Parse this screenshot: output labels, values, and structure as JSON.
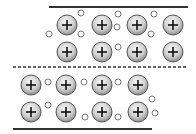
{
  "diagram": {
    "title": "",
    "top_plate": {
      "line": {
        "x1": 49,
        "x2": 188,
        "y": 7,
        "style": "solid"
      },
      "ions": [
        {
          "cx": 67,
          "cy": 25
        },
        {
          "cx": 102,
          "cy": 25
        },
        {
          "cx": 137,
          "cy": 25
        },
        {
          "cx": 173,
          "cy": 25
        },
        {
          "cx": 67,
          "cy": 52
        },
        {
          "cx": 102,
          "cy": 52
        },
        {
          "cx": 137,
          "cy": 52
        },
        {
          "cx": 173,
          "cy": 52
        }
      ],
      "electrons": [
        {
          "cx": 81,
          "cy": 13
        },
        {
          "cx": 49,
          "cy": 34
        },
        {
          "cx": 81,
          "cy": 34
        },
        {
          "cx": 118,
          "cy": 14
        },
        {
          "cx": 117,
          "cy": 27
        },
        {
          "cx": 154,
          "cy": 14
        },
        {
          "cx": 151,
          "cy": 34
        },
        {
          "cx": 118,
          "cy": 47
        }
      ]
    },
    "bottom_plate": {
      "line": {
        "x1": 13,
        "x2": 152,
        "y": 129,
        "style": "solid"
      },
      "ions": [
        {
          "cx": 31,
          "cy": 85
        },
        {
          "cx": 66,
          "cy": 85
        },
        {
          "cx": 102,
          "cy": 85
        },
        {
          "cx": 138,
          "cy": 85
        },
        {
          "cx": 31,
          "cy": 112
        },
        {
          "cx": 66,
          "cy": 112
        },
        {
          "cx": 102,
          "cy": 112
        },
        {
          "cx": 138,
          "cy": 112
        }
      ],
      "electrons": [
        {
          "cx": 48,
          "cy": 82
        },
        {
          "cx": 84,
          "cy": 82
        },
        {
          "cx": 118,
          "cy": 82
        },
        {
          "cx": 48,
          "cy": 105
        },
        {
          "cx": 85,
          "cy": 117
        },
        {
          "cx": 118,
          "cy": 117
        },
        {
          "cx": 152,
          "cy": 99
        },
        {
          "cx": 155,
          "cy": 113
        }
      ]
    },
    "slip_plane": {
      "x1": 13,
      "x2": 187,
      "y": 67,
      "style": "dashed"
    },
    "ion_symbol": "+",
    "ion_radius": 10,
    "electron_radius": 3,
    "colors": {
      "line": "#333333",
      "ion_light": "#f4f4f4",
      "ion_dark": "#9a9a9a",
      "ion_stroke": "#555555",
      "electron_stroke": "#777777"
    }
  }
}
